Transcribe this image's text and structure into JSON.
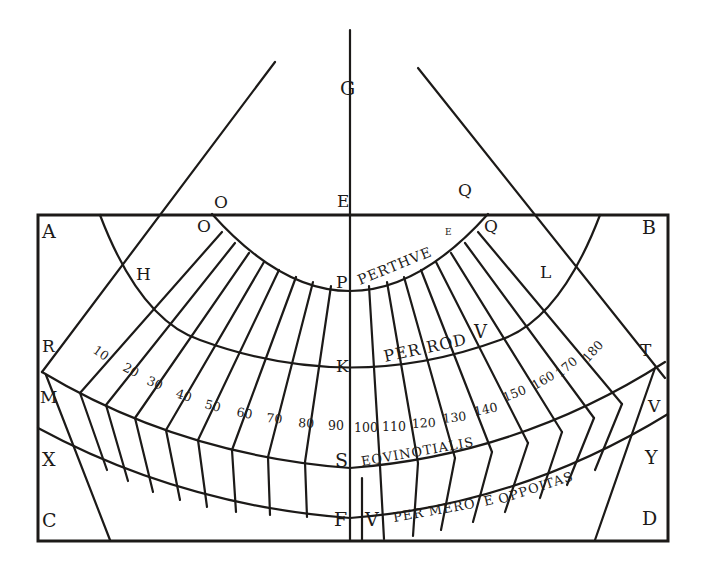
{
  "diagram": {
    "type": "geometric dial construction (woodcut)",
    "ink_color": "#1c1a18",
    "paper_color": "#ffffff",
    "point_labels": {
      "G": "G",
      "E": "E",
      "O_outer": "O",
      "O_inner": "O",
      "Q_outer": "Q",
      "Q_inner": "Q",
      "A": "A",
      "B": "B",
      "C": "C",
      "D": "D",
      "H": "H",
      "L": "L",
      "P": "P",
      "K": "K",
      "R": "R",
      "T": "T",
      "M": "M",
      "V_right": "V",
      "X": "X",
      "Y": "Y",
      "S": "S",
      "F": "F",
      "V_bottom": "V"
    },
    "band_captions": {
      "perthue": "PERTHVE",
      "perthue_sup": "E",
      "perrod": "PER ROD",
      "perrod_v": "V",
      "equinotialis": "EQVINOTIALIS",
      "permero": "PER MERO",
      "oppoitas": "OPPOITAS",
      "permero_e": "E"
    },
    "scale_numbers": [
      "10",
      "20",
      "30",
      "40",
      "50",
      "60",
      "70",
      "80",
      "90",
      "100",
      "110",
      "120",
      "130",
      "140",
      "150",
      "160",
      "170",
      "180"
    ]
  }
}
